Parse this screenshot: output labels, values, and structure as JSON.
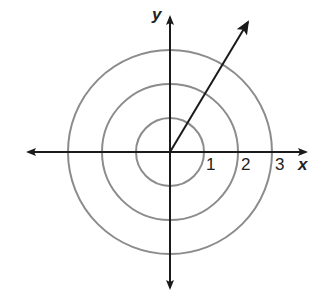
{
  "diagram": {
    "title": "",
    "axes": {
      "x_label": "x",
      "y_label": "y"
    },
    "circles": [
      {
        "radius": 1,
        "label": "1"
      },
      {
        "radius": 2,
        "label": "2"
      },
      {
        "radius": 3,
        "label": "3"
      }
    ],
    "vector": {
      "from": [
        0,
        0
      ],
      "direction": "up-right",
      "description": "arrow from origin extending beyond outer circle"
    },
    "colors": {
      "axis": "#1a1a1a",
      "circle": "#8c8c8c",
      "background": "#ffffff"
    }
  }
}
